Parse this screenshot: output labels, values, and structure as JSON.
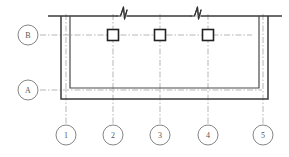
{
  "drawing": {
    "type": "structural-floor-plan",
    "title": "",
    "canvas": {
      "width": 289,
      "height": 157
    },
    "colors": {
      "wall_outline": "#3a3a3a",
      "inner_wall": "#4a4a4a",
      "gridline": "#9a9a9a",
      "bubble_stroke": "#777777",
      "bubble_text": "#555555",
      "column_stroke": "#222222",
      "column_fill": "#ffffff",
      "break_symbol": "#333333",
      "background": "#ffffff"
    }
  },
  "grid": {
    "horizontal_axes": [
      {
        "label": "B",
        "bubble_cx": 28,
        "bubble_cy": 35,
        "y": 35,
        "x_start": 40,
        "x_end": 252
      },
      {
        "label": "A",
        "bubble_cx": 28,
        "bubble_cy": 90,
        "y": 90,
        "x_start": 40,
        "x_end": 262
      }
    ],
    "vertical_axes": [
      {
        "label": "1",
        "bubble_cx": 66,
        "bubble_cy": 135,
        "x": 66,
        "y_start": 14,
        "y_end": 124
      },
      {
        "label": "2",
        "bubble_cx": 113,
        "bubble_cy": 135,
        "x": 113,
        "y_start": 14,
        "y_end": 124
      },
      {
        "label": "3",
        "bubble_cx": 160,
        "bubble_cy": 135,
        "x": 160,
        "y_start": 14,
        "y_end": 124
      },
      {
        "label": "4",
        "bubble_cx": 208,
        "bubble_cy": 135,
        "x": 208,
        "y_start": 14,
        "y_end": 124
      },
      {
        "label": "5",
        "bubble_cx": 263,
        "bubble_cy": 135,
        "x": 263,
        "y_start": 14,
        "y_end": 124
      }
    ],
    "bubble_radius": 10
  },
  "structure": {
    "top_line": {
      "x_start": 48,
      "x_end": 282,
      "y": 16
    },
    "outer_wall": {
      "left_x": 61,
      "right_x": 268,
      "top_y": 16,
      "bottom_y": 99
    },
    "inner_wall": {
      "left_x": 70,
      "right_x": 259,
      "top_y": 16,
      "bottom_y": 88
    },
    "wall_thickness_px": 9
  },
  "columns": [
    {
      "name": "column-grid-2-B",
      "cx": 113,
      "cy": 35,
      "size": 11
    },
    {
      "name": "column-grid-3-B",
      "cx": 160,
      "cy": 35,
      "size": 11
    },
    {
      "name": "column-grid-4-B",
      "cx": 208,
      "cy": 35,
      "size": 11
    }
  ],
  "break_symbols": [
    {
      "name": "break-symbol-left",
      "x": 122,
      "y": 16
    },
    {
      "name": "break-symbol-right",
      "x": 196,
      "y": 16
    }
  ]
}
